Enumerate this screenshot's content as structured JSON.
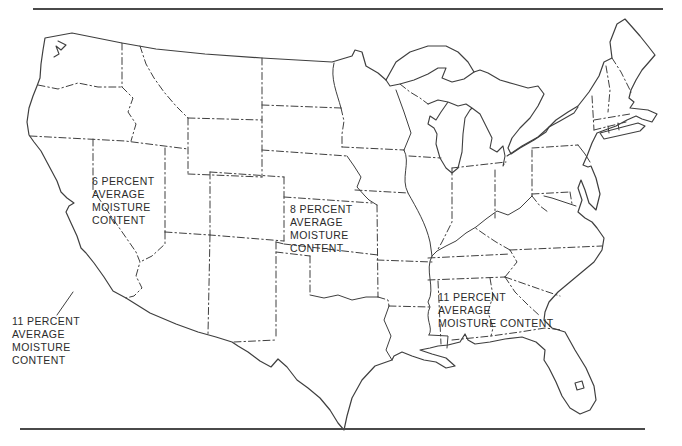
{
  "page": {
    "background_color": "#ffffff",
    "ink_color": "#3f3f3f",
    "rule_color": "#4a4a4a"
  },
  "map": {
    "labels": {
      "west_coast": {
        "lines": [
          "11 PERCENT",
          "AVERAGE",
          "MOISTURE",
          "CONTENT"
        ]
      },
      "west_interior": {
        "lines": [
          "6 PERCENT",
          "AVERAGE",
          "MOISTURE",
          "CONTENT"
        ]
      },
      "central": {
        "lines": [
          "8 PERCENT",
          "AVERAGE",
          "MOISTURE",
          "CONTENT"
        ]
      },
      "southeast": {
        "lines": [
          "11 PERCENT",
          "AVERAGE",
          "MOISTURE CONTENT"
        ]
      }
    }
  }
}
